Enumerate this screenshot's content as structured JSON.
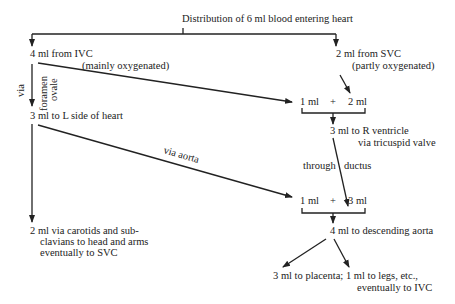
{
  "title": "Distribution of 6 ml blood entering heart",
  "nodes": {
    "ivc": "4 ml from IVC",
    "ivc_note": "(mainly oxygenated)",
    "svc": "2 ml from SVC",
    "svc_note": "(partly oxygenated)",
    "via": "via",
    "foramen": "foramen",
    "ovale": "ovale",
    "left_heart": "3 ml to L side of heart",
    "sum1_a": "1 ml",
    "sum1_plus": "+",
    "sum1_b": "2 ml",
    "r_ventricle": "3 ml to R ventricle",
    "r_ventricle_note": "via tricuspid valve",
    "through": "through",
    "ductus": "ductus",
    "via_aorta": "via aorta",
    "sum2_a": "1 ml",
    "sum2_plus": "+",
    "sum2_b": "3 ml",
    "head_arms_1": "2 ml via carotids and sub-",
    "head_arms_2": "clavians to head and arms",
    "head_arms_3": "eventually to SVC",
    "desc_aorta": "4 ml to descending aorta",
    "placenta": "3 ml to placenta; 1 ml to legs, etc.,",
    "placenta_2": "eventually to IVC"
  },
  "colors": {
    "ink": "#222222",
    "background": "#ffffff"
  }
}
